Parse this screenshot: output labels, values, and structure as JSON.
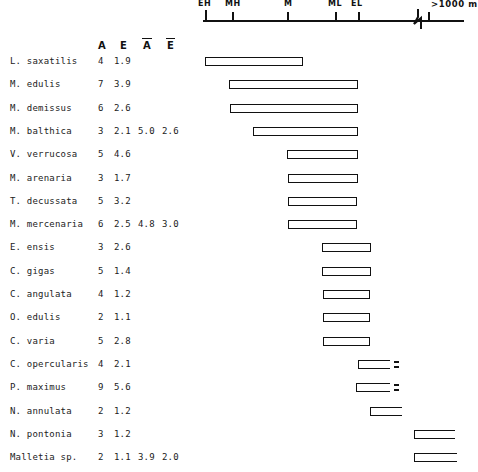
{
  "axis": {
    "name": "depth-axis",
    "unit_label": ">1000 m",
    "ticks": [
      {
        "label": "EH",
        "x": 205
      },
      {
        "label": "MH",
        "x": 232
      },
      {
        "label": "M",
        "x": 287
      },
      {
        "label": "ML",
        "x": 335
      },
      {
        "label": "EL",
        "x": 358
      }
    ],
    "break_x": 412,
    "deep_tick_x": 428,
    "line_start": 203,
    "line_end": 464
  },
  "columns": {
    "headers": [
      "A",
      "E",
      "Ā",
      "Ē"
    ],
    "header_a": "A",
    "header_e": "E",
    "header_a_bar": "A",
    "header_e_bar": "E"
  },
  "chart_data": {
    "type": "bar",
    "title": "",
    "xlabel": "",
    "ylabel": "",
    "orientation": "horizontal-range",
    "axis_categories": [
      "EH",
      "MH",
      "M",
      "ML",
      "EL",
      ">1000 m"
    ],
    "columns": [
      "Species",
      "A",
      "E",
      "Ā",
      "Ē"
    ],
    "rows": [
      {
        "species": "L. saxatilis",
        "a": "4",
        "e": "1.9",
        "abar": "",
        "ebar": "",
        "bar_start": 205,
        "bar_end": 303,
        "open_right": false,
        "dash": false
      },
      {
        "species": "M. edulis",
        "a": "7",
        "e": "3.9",
        "abar": "",
        "ebar": "",
        "bar_start": 229,
        "bar_end": 358,
        "open_right": false,
        "dash": false
      },
      {
        "species": "M. demissus",
        "a": "6",
        "e": "2.6",
        "abar": "",
        "ebar": "",
        "bar_start": 230,
        "bar_end": 358,
        "open_right": false,
        "dash": false
      },
      {
        "species": "M. balthica",
        "a": "3",
        "e": "2.1",
        "abar": "5.0",
        "ebar": "2.6",
        "bar_start": 253,
        "bar_end": 358,
        "open_right": false,
        "dash": false
      },
      {
        "species": "V. verrucosa",
        "a": "5",
        "e": "4.6",
        "abar": "",
        "ebar": "",
        "bar_start": 287,
        "bar_end": 358,
        "open_right": false,
        "dash": false
      },
      {
        "species": "M. arenaria",
        "a": "3",
        "e": "1.7",
        "abar": "",
        "ebar": "",
        "bar_start": 288,
        "bar_end": 358,
        "open_right": false,
        "dash": false
      },
      {
        "species": "T. decussata",
        "a": "5",
        "e": "3.2",
        "abar": "",
        "ebar": "",
        "bar_start": 288,
        "bar_end": 357,
        "open_right": false,
        "dash": false
      },
      {
        "species": "M. mercenaria",
        "a": "6",
        "e": "2.5",
        "abar": "4.8",
        "ebar": "3.0",
        "bar_start": 288,
        "bar_end": 357,
        "open_right": false,
        "dash": false
      },
      {
        "species": "E. ensis",
        "a": "3",
        "e": "2.6",
        "abar": "",
        "ebar": "",
        "bar_start": 322,
        "bar_end": 371,
        "open_right": false,
        "dash": false
      },
      {
        "species": "C. gigas",
        "a": "5",
        "e": "1.4",
        "abar": "",
        "ebar": "",
        "bar_start": 322,
        "bar_end": 371,
        "open_right": false,
        "dash": false
      },
      {
        "species": "C. angulata",
        "a": "4",
        "e": "1.2",
        "abar": "",
        "ebar": "",
        "bar_start": 323,
        "bar_end": 370,
        "open_right": false,
        "dash": false
      },
      {
        "species": "O. edulis",
        "a": "2",
        "e": "1.1",
        "abar": "",
        "ebar": "",
        "bar_start": 323,
        "bar_end": 370,
        "open_right": false,
        "dash": false
      },
      {
        "species": "C. varia",
        "a": "5",
        "e": "2.8",
        "abar": "",
        "ebar": "",
        "bar_start": 323,
        "bar_end": 370,
        "open_right": false,
        "dash": false
      },
      {
        "species": "C. opercularis",
        "a": "4",
        "e": "2.1",
        "abar": "",
        "ebar": "",
        "bar_start": 358,
        "bar_end": 390,
        "open_right": true,
        "dash": true
      },
      {
        "species": "P. maximus",
        "a": "9",
        "e": "5.6",
        "abar": "",
        "ebar": "",
        "bar_start": 356,
        "bar_end": 390,
        "open_right": true,
        "dash": true
      },
      {
        "species": "N. annulata",
        "a": "2",
        "e": "1.2",
        "abar": "",
        "ebar": "",
        "bar_start": 370,
        "bar_end": 402,
        "open_right": true,
        "dash": false
      },
      {
        "species": "N. pontonia",
        "a": "3",
        "e": "1.2",
        "abar": "",
        "ebar": "",
        "bar_start": 414,
        "bar_end": 455,
        "open_right": true,
        "dash": false
      },
      {
        "species": "Malletia sp.",
        "a": "2",
        "e": "1.1",
        "abar": "3.9",
        "ebar": "2.0",
        "bar_start": 414,
        "bar_end": 457,
        "open_right": true,
        "dash": false
      }
    ]
  }
}
